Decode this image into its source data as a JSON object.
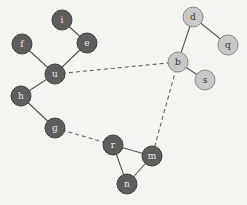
{
  "diagram": {
    "type": "graph",
    "colors": {
      "community_dark": "#5e5e5e",
      "community_light": "#c8c8c8",
      "edge": "#555555"
    },
    "nodes": [
      {
        "id": "i",
        "x": 62,
        "y": 20,
        "group": "dark"
      },
      {
        "id": "f",
        "x": 22,
        "y": 44,
        "group": "dark"
      },
      {
        "id": "e",
        "x": 87,
        "y": 43,
        "group": "dark"
      },
      {
        "id": "u",
        "x": 55,
        "y": 74,
        "group": "dark"
      },
      {
        "id": "h",
        "x": 21,
        "y": 96,
        "group": "dark"
      },
      {
        "id": "g",
        "x": 55,
        "y": 128,
        "group": "dark"
      },
      {
        "id": "r",
        "x": 113,
        "y": 145,
        "group": "dark"
      },
      {
        "id": "m",
        "x": 152,
        "y": 156,
        "group": "dark"
      },
      {
        "id": "n",
        "x": 127,
        "y": 184,
        "group": "dark"
      },
      {
        "id": "d",
        "x": 193,
        "y": 17,
        "group": "light"
      },
      {
        "id": "q",
        "x": 228,
        "y": 45,
        "group": "light"
      },
      {
        "id": "b",
        "x": 178,
        "y": 62,
        "group": "light"
      },
      {
        "id": "s",
        "x": 205,
        "y": 80,
        "group": "light"
      }
    ],
    "edges": [
      {
        "from": "i",
        "to": "e",
        "style": "solid"
      },
      {
        "from": "f",
        "to": "u",
        "style": "solid"
      },
      {
        "from": "e",
        "to": "u",
        "style": "solid"
      },
      {
        "from": "u",
        "to": "h",
        "style": "solid"
      },
      {
        "from": "h",
        "to": "g",
        "style": "solid"
      },
      {
        "from": "r",
        "to": "m",
        "style": "solid"
      },
      {
        "from": "r",
        "to": "n",
        "style": "solid"
      },
      {
        "from": "m",
        "to": "n",
        "style": "solid"
      },
      {
        "from": "d",
        "to": "b",
        "style": "solid"
      },
      {
        "from": "d",
        "to": "q",
        "style": "solid"
      },
      {
        "from": "b",
        "to": "s",
        "style": "solid"
      },
      {
        "from": "u",
        "to": "b",
        "style": "dashed"
      },
      {
        "from": "g",
        "to": "r",
        "style": "dashed"
      },
      {
        "from": "b",
        "to": "m",
        "style": "dashed"
      }
    ]
  }
}
